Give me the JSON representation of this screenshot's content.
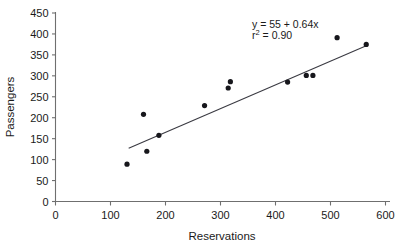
{
  "chart_data": {
    "type": "scatter",
    "title": "",
    "xlabel": "Reservations",
    "ylabel": "Passengers",
    "xlim": [
      0,
      600
    ],
    "ylim": [
      0,
      450
    ],
    "xticks": [
      0,
      100,
      200,
      300,
      400,
      500,
      600
    ],
    "yticks": [
      0,
      50,
      100,
      150,
      200,
      250,
      300,
      350,
      400,
      450
    ],
    "grid": false,
    "legend": "none",
    "marker": "filled-circle",
    "marker_color": "#17171c",
    "points": [
      {
        "x": 130,
        "y": 89
      },
      {
        "x": 160,
        "y": 208
      },
      {
        "x": 166,
        "y": 120
      },
      {
        "x": 188,
        "y": 158
      },
      {
        "x": 271,
        "y": 229
      },
      {
        "x": 314,
        "y": 271
      },
      {
        "x": 318,
        "y": 286
      },
      {
        "x": 422,
        "y": 285
      },
      {
        "x": 456,
        "y": 301
      },
      {
        "x": 468,
        "y": 301
      },
      {
        "x": 512,
        "y": 391
      },
      {
        "x": 565,
        "y": 375
      }
    ],
    "series": [
      {
        "name": "Passengers vs Reservations",
        "x": [
          130,
          160,
          166,
          188,
          271,
          314,
          318,
          422,
          456,
          468,
          512,
          565
        ],
        "values": [
          89,
          208,
          120,
          158,
          229,
          271,
          286,
          285,
          301,
          301,
          391,
          375
        ]
      }
    ],
    "fit_line": {
      "type": "linear-regression",
      "intercept": 55,
      "slope": 0.64,
      "r_squared": 0.9,
      "x_start": 133,
      "y_start": 127,
      "x_end": 565,
      "y_end": 372,
      "color": "#3a3a42"
    },
    "annotations": [
      {
        "name": "equation",
        "text_prefix": "y",
        "text_sub": "2",
        "text_main": " = 55 + 0.64x"
      },
      {
        "name": "r-squared",
        "text_prefix": "r",
        "text_sub": "2",
        "text_main": " = 0.90"
      }
    ],
    "annotation_lines": {
      "equation_full": "y = 55 + 0.64x",
      "equation_lead": "y",
      "equation_rest": " = 55 + 0.64x",
      "rsq_full": "r2 = 0.90",
      "rsq_lead": "r",
      "rsq_sup": "2",
      "rsq_rest": " = 0.90"
    },
    "xtick_labels": [
      "0",
      "100",
      "200",
      "300",
      "400",
      "500",
      "600"
    ],
    "ytick_labels": [
      "0",
      "50",
      "100",
      "150",
      "200",
      "250",
      "300",
      "350",
      "400",
      "450"
    ]
  },
  "axes": {
    "x_title": "Reservations",
    "y_title": "Passengers"
  }
}
